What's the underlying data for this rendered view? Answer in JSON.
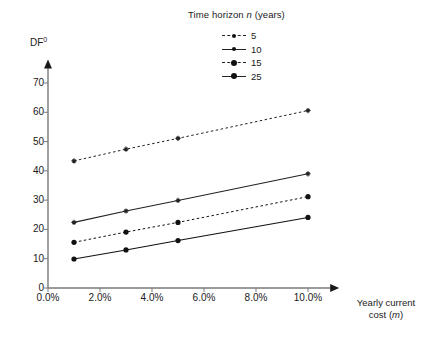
{
  "chart_data": {
    "type": "line",
    "title": "",
    "legend_title": "Time horizon n (years)",
    "legend_title_parts": {
      "prefix": "Time horizon ",
      "italic": "n",
      "suffix": " (years)"
    },
    "legend_position": "top-center",
    "xlabel": "Yearly current cost (m)",
    "xlabel_parts": {
      "line1": "Yearly current",
      "line2_prefix": "cost (",
      "line2_italic": "m",
      "line2_suffix": ")"
    },
    "ylabel": "DF0",
    "ylabel_parts": {
      "base": "DF",
      "superscript": "0"
    },
    "x": [
      1,
      3,
      5,
      10
    ],
    "x_unit": "percent",
    "xtick_labels": [
      "0.0%",
      "2.0%",
      "4.0%",
      "6.0%",
      "8.0%",
      "10.0%"
    ],
    "xtick_values": [
      0,
      2,
      4,
      6,
      8,
      10
    ],
    "ytick_labels": [
      "0",
      "10",
      "20",
      "30",
      "40",
      "50",
      "60",
      "70"
    ],
    "ytick_values": [
      0,
      10,
      20,
      30,
      40,
      50,
      60,
      70
    ],
    "xlim": [
      0,
      11.2
    ],
    "ylim": [
      0,
      78
    ],
    "grid": false,
    "series": [
      {
        "name": "5",
        "legend_label": "5",
        "line_style": "dashed",
        "marker": "small-dot",
        "color": "#222222",
        "values": [
          43.4,
          47.4,
          51.1,
          60.6
        ]
      },
      {
        "name": "10",
        "legend_label": "10",
        "line_style": "solid",
        "marker": "small-dot",
        "color": "#222222",
        "values": [
          22.4,
          26.3,
          29.9,
          39.0
        ]
      },
      {
        "name": "15",
        "legend_label": "15",
        "line_style": "dashed",
        "marker": "dot",
        "color": "#111111",
        "values": [
          15.6,
          19.1,
          22.4,
          31.2
        ]
      },
      {
        "name": "25",
        "legend_label": "25",
        "line_style": "solid",
        "marker": "dot",
        "color": "#111111",
        "values": [
          9.9,
          13.0,
          16.2,
          24.1
        ]
      }
    ],
    "axis_color": "#7a7a7a",
    "arrow_color": "#1a1a1a",
    "background": "#ffffff"
  }
}
